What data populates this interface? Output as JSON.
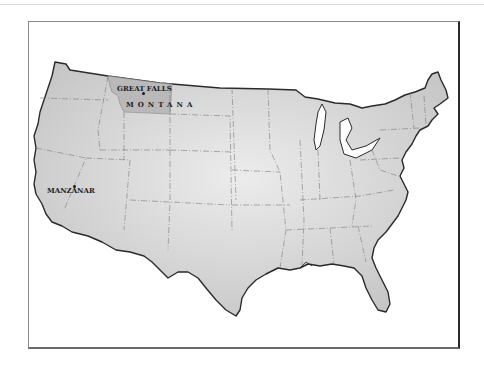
{
  "map": {
    "title": "Contiguous United States",
    "highlighted_state": {
      "name": "MONTANA",
      "fill": "#b9b9b9"
    },
    "base_fill": "#dcdcdc",
    "border_color": "#2a2a2a",
    "state_line_color": "#7a7a7a",
    "places": [
      {
        "label": "GREAT FALLS",
        "type": "city"
      },
      {
        "label": "MANZANAR",
        "type": "site"
      }
    ],
    "state_label": "MONTANA",
    "signature": "..."
  }
}
